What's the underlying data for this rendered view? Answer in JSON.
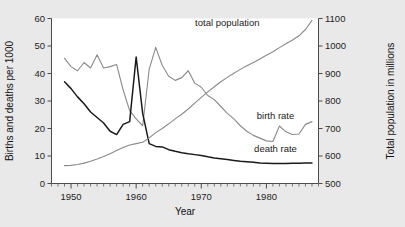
{
  "chart_data": {
    "type": "line",
    "title": "",
    "subtitle": "",
    "xlabel": "Year",
    "ylabel": "Births and deaths per 1000",
    "ylabel_right": "Total population in millions",
    "xlim": [
      1947,
      1988
    ],
    "ylim": [
      0,
      60
    ],
    "ylim_right": [
      500,
      1100
    ],
    "xticks": [
      1950,
      1960,
      1970,
      1980
    ],
    "xticklabels": [
      "1950",
      "1960",
      "1970",
      "1980"
    ],
    "xminortick_interval": 1,
    "yticks": [
      0,
      10,
      20,
      30,
      40,
      50,
      60
    ],
    "yticklabels": [
      "0",
      "10",
      "20",
      "30",
      "40",
      "50",
      "60"
    ],
    "yticks_right": [
      500,
      600,
      700,
      800,
      900,
      1000,
      1100
    ],
    "yticklabels_right": [
      "500",
      "600",
      "700",
      "800",
      "900",
      "1000",
      "1100"
    ],
    "grid": false,
    "legend_position": "inline-annotations",
    "annotations": [
      {
        "text": "total population",
        "x": 1974.0,
        "y": 57.3,
        "axis": "left"
      },
      {
        "text": "birth rate",
        "x": 1981.4,
        "y": 23.4,
        "axis": "left"
      },
      {
        "text": "death rate",
        "x": 1981.4,
        "y": 11.3,
        "axis": "left"
      }
    ],
    "x": [
      1949,
      1950,
      1951,
      1952,
      1953,
      1954,
      1955,
      1956,
      1957,
      1958,
      1959,
      1960,
      1961,
      1962,
      1963,
      1964,
      1965,
      1966,
      1967,
      1968,
      1969,
      1970,
      1971,
      1972,
      1973,
      1974,
      1975,
      1976,
      1977,
      1978,
      1979,
      1980,
      1981,
      1982,
      1983,
      1984,
      1985,
      1986,
      1987
    ],
    "series": [
      {
        "name": "birth rate",
        "color": "#8a8a8a",
        "axis": "left",
        "unit": "per 1000",
        "values": [
          45.5,
          42.5,
          41.0,
          44.0,
          42.0,
          46.8,
          42.0,
          42.5,
          43.3,
          34.0,
          26.5,
          23.5,
          21.0,
          41.5,
          49.5,
          43.0,
          39.0,
          37.5,
          38.5,
          41.0,
          36.5,
          35.0,
          32.0,
          30.5,
          28.0,
          25.5,
          23.5,
          21.0,
          19.0,
          17.5,
          16.5,
          15.5,
          15.3,
          20.9,
          18.8,
          17.8,
          18.0,
          21.5,
          22.5
        ]
      },
      {
        "name": "death rate",
        "color": "#1a1a1a",
        "axis": "left",
        "unit": "per 1000",
        "values": [
          37.0,
          34.5,
          31.5,
          29.0,
          26.0,
          24.0,
          22.0,
          19.0,
          17.8,
          21.5,
          22.5,
          46.0,
          25.5,
          14.5,
          13.5,
          13.3,
          12.3,
          11.7,
          11.2,
          10.8,
          10.5,
          10.2,
          9.7,
          9.3,
          9.0,
          8.7,
          8.4,
          8.1,
          7.9,
          7.7,
          7.5,
          7.4,
          7.3,
          7.3,
          7.3,
          7.4,
          7.4,
          7.5,
          7.5
        ]
      },
      {
        "name": "total population",
        "color": "#8a8a8a",
        "axis": "right",
        "unit": "millions",
        "values": [
          565,
          566,
          569,
          574,
          581,
          589,
          598,
          608,
          620,
          631,
          640,
          645,
          650,
          666,
          685,
          700,
          717,
          735,
          752,
          771,
          792,
          813,
          833,
          852,
          870,
          886,
          901,
          915,
          928,
          940,
          953,
          966,
          979,
          994,
          1008,
          1022,
          1037,
          1060,
          1093
        ]
      }
    ]
  }
}
